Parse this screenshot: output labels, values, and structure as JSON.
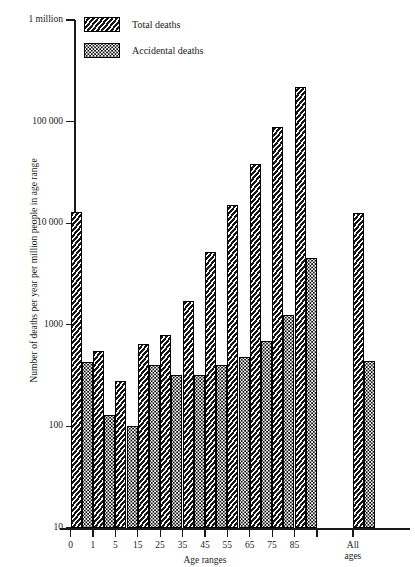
{
  "chart_data": {
    "type": "bar",
    "title": "",
    "xlabel": "Age ranges",
    "ylabel": "Number of deaths per year per million people in age range",
    "yscale": "log",
    "ylim": [
      10,
      1000000
    ],
    "ytick_values": [
      10,
      100,
      1000,
      10000,
      100000,
      1000000
    ],
    "ytick_labels": [
      "10",
      "100",
      "1000",
      "10 000",
      "100 000",
      "1 million"
    ],
    "grid": false,
    "legend_position": "top-left",
    "categories": [
      "0",
      "1",
      "5",
      "15",
      "25",
      "35",
      "45",
      "55",
      "65",
      "75",
      "85",
      "All ages"
    ],
    "series": [
      {
        "name": "Total deaths",
        "pattern": "diagonal-hatch",
        "values": [
          13000,
          550,
          280,
          650,
          800,
          1700,
          5200,
          15000,
          38000,
          88000,
          220000,
          12500
        ]
      },
      {
        "name": "Accidental deaths",
        "pattern": "dotted",
        "values": [
          430,
          130,
          100,
          400,
          320,
          320,
          400,
          480,
          700,
          1250,
          4500,
          440
        ]
      }
    ]
  },
  "legend": {
    "items": [
      {
        "label": "Total deaths"
      },
      {
        "label": "Accidental deaths"
      }
    ]
  },
  "axes": {
    "y_title": "Number of deaths per year per million people in age range",
    "x_title": "Age ranges",
    "y_labels": [
      "1 million",
      "100 000",
      "10 000",
      "1000",
      "100",
      "10"
    ],
    "x_labels": [
      "0",
      "1",
      "5",
      "15",
      "25",
      "35",
      "45",
      "55",
      "65",
      "75",
      "85",
      "All\nages"
    ]
  }
}
